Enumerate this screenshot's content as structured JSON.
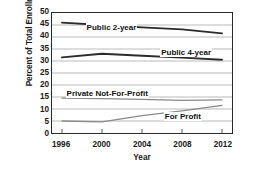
{
  "chart_data": {
    "type": "line",
    "title": "",
    "xlabel": "Year",
    "ylabel": "Percent of Total Enrollment",
    "x": [
      1996,
      2000,
      2004,
      2008,
      2012
    ],
    "xlim": [
      1995,
      2013
    ],
    "ylim": [
      0,
      50
    ],
    "yticks": [
      50,
      45,
      40,
      35,
      30,
      25,
      20,
      15,
      10,
      5,
      0
    ],
    "xticks": [
      "1996",
      "2000",
      "2004",
      "2008",
      "2012"
    ],
    "grid": "horizontal",
    "legend": "inline-labels",
    "series": [
      {
        "name": "Public 2-year",
        "values": [
          46.0,
          45.0,
          44.0,
          43.2,
          41.5
        ],
        "color": "#2b2b2b"
      },
      {
        "name": "Public 4-year",
        "values": [
          31.5,
          33.0,
          32.2,
          31.4,
          30.5
        ],
        "color": "#2b2b2b"
      },
      {
        "name": "Private Not-For-Profit",
        "values": [
          14.5,
          14.3,
          14.0,
          13.6,
          13.8
        ],
        "color": "#8a8a8a"
      },
      {
        "name": "For Profit",
        "values": [
          5.0,
          4.6,
          7.2,
          9.2,
          11.5
        ],
        "color": "#8a8a8a"
      }
    ],
    "annotations": [
      {
        "text": "Public 2-year",
        "x_pct": 19,
        "y_value": 43.6
      },
      {
        "text": "Public 4-year",
        "x_pct": 60,
        "y_value": 33.4
      },
      {
        "text": "Private Not-For-Profit",
        "x_pct": 8,
        "y_value": 16.3
      },
      {
        "text": "For Profit",
        "x_pct": 62,
        "y_value": 7.0
      }
    ]
  }
}
